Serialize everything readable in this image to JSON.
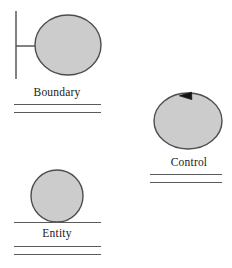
{
  "diagram": {
    "background_color": "#ffffff",
    "shape_fill_color": "#cccccc",
    "shape_stroke_color": "#4d4d4d",
    "rule_color": "#5a5a5a",
    "text_color": "#1a1a1a"
  },
  "elements": [
    {
      "id": "boundary",
      "label": "Boundary",
      "icon_name": "boundary-stereotype-icon",
      "shape": "ellipse-with-stem",
      "rule_count": 2
    },
    {
      "id": "control",
      "label": "Control",
      "icon_name": "control-stereotype-icon",
      "shape": "circle-with-arrowhead",
      "arrow_direction": "counter-clockwise",
      "rule_count": 2
    },
    {
      "id": "entity",
      "label": "Entity",
      "icon_name": "entity-stereotype-icon",
      "shape": "circle-on-baseline",
      "rule_count": 3
    }
  ]
}
